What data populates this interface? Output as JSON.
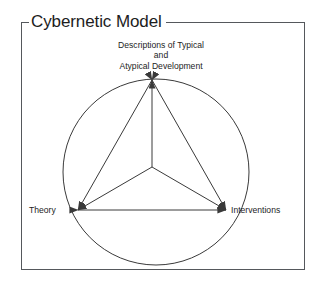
{
  "figure": {
    "title": "Cybernetic Model",
    "frame_color": "#55585c",
    "line_color": "#3a3a3a",
    "text_color": "#1d1d1d",
    "background": "#ffffff"
  },
  "diagram": {
    "type": "triangle-in-circle",
    "nodes": [
      {
        "id": "top",
        "lines": [
          "Descriptions of Typical",
          "and",
          "Atypical Development"
        ],
        "text": "Descriptions of Typical and Atypical Development",
        "x": 152,
        "y": 80
      },
      {
        "id": "left",
        "lines": [
          "Theory"
        ],
        "text": "Theory",
        "x": 78,
        "y": 210
      },
      {
        "id": "right",
        "lines": [
          "Interventions"
        ],
        "text": "Interventions",
        "x": 226,
        "y": 210
      }
    ],
    "hub": {
      "x": 152,
      "y": 167
    },
    "circle": {
      "cx": 156,
      "cy": 172,
      "r": 93
    },
    "edges": [
      {
        "from": "top",
        "to": "left",
        "arrows": "both"
      },
      {
        "from": "top",
        "to": "right",
        "arrows": "both"
      },
      {
        "from": "left",
        "to": "right",
        "arrows": "both"
      },
      {
        "from": "hub",
        "to": "top",
        "arrows": "end"
      },
      {
        "from": "hub",
        "to": "left",
        "arrows": "end"
      },
      {
        "from": "hub",
        "to": "right",
        "arrows": "end"
      }
    ]
  },
  "labels": {
    "top_line1": "Descriptions of Typical",
    "top_line2": "and",
    "top_line3": "Atypical Development",
    "left": "Theory",
    "right": "Interventions"
  }
}
